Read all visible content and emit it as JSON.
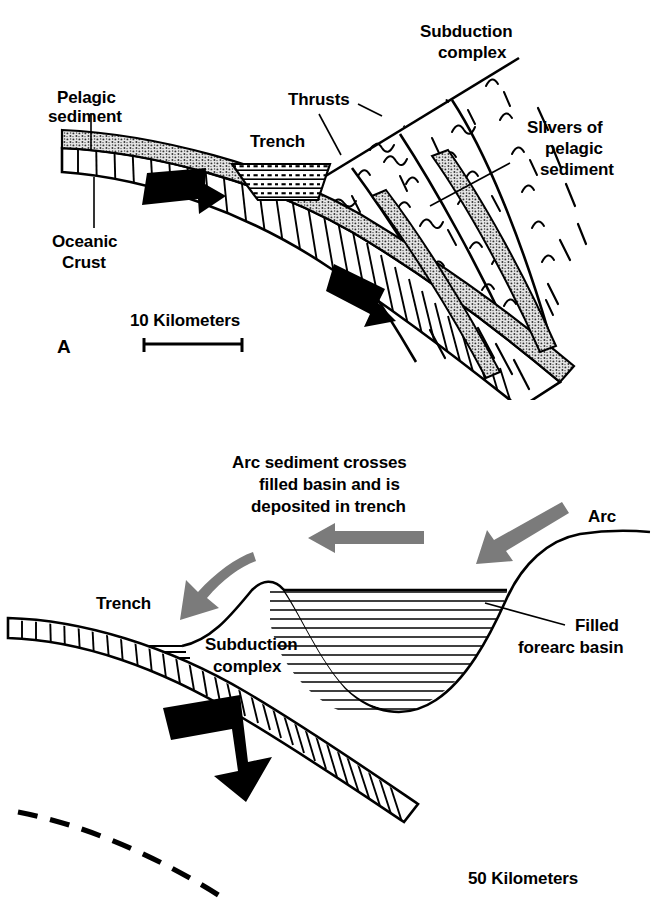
{
  "figure": {
    "background_color": "#ffffff",
    "ink_color": "#000000",
    "accent_gray": "#7b7b7b",
    "stipple_gray": "#d9d9d9"
  },
  "panel_a": {
    "letter": "A",
    "labels": {
      "pelagic_sediment": "Pelagic\nsediment",
      "pelagic_sediment_line1": "Pelagic",
      "pelagic_sediment_line2": "sediment",
      "oceanic_crust_line1": "Oceanic",
      "oceanic_crust_line2": "Crust",
      "trench": "Trench",
      "thrusts": "Thrusts",
      "subduction_complex_line1": "Subduction",
      "subduction_complex_line2": "complex",
      "slivers_line1": "Slivers of",
      "slivers_line2": "pelagic",
      "slivers_line3": "sediment"
    },
    "scale": {
      "label": "10 Kilometers",
      "value": 10,
      "unit": "Kilometers"
    }
  },
  "panel_b": {
    "caption_line1": "Arc sediment crosses",
    "caption_line2": "filled basin and is",
    "caption_line3": "deposited in trench",
    "labels": {
      "arc": "Arc",
      "trench": "Trench",
      "subduction_complex_line1": "Subduction",
      "subduction_complex_line2": "complex",
      "filled_forearc_basin_line1": "Filled",
      "filled_forearc_basin_line2": "forearc basin"
    },
    "scale": {
      "label": "50 Kilometers",
      "value": 50,
      "unit": "Kilometers"
    }
  }
}
